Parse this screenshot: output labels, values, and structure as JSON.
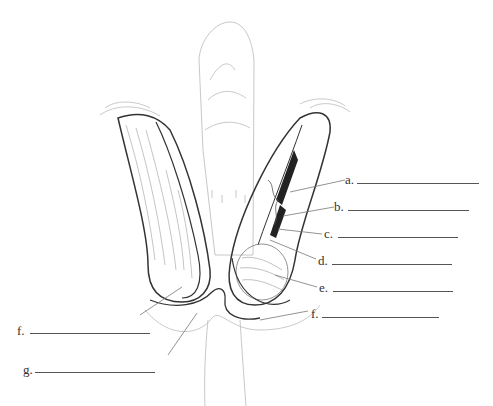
{
  "figure": {
    "labels": [
      {
        "id": "a",
        "text": "a.",
        "x": 345,
        "y": 173,
        "blank_x": 357,
        "blank_w": 122,
        "leader": [
          [
            345,
            180
          ],
          [
            290,
            192
          ]
        ]
      },
      {
        "id": "b",
        "text": "b.",
        "x": 334,
        "y": 200,
        "blank_x": 348,
        "blank_w": 121,
        "leader": [
          [
            334,
            207
          ],
          [
            283,
            216
          ]
        ]
      },
      {
        "id": "c",
        "text": "c.",
        "x": 324,
        "y": 227,
        "blank_x": 338,
        "blank_w": 120,
        "leader": [
          [
            322,
            234
          ],
          [
            278,
            229
          ]
        ]
      },
      {
        "id": "d",
        "text": "d.",
        "x": 318,
        "y": 254,
        "blank_x": 332,
        "blank_w": 120,
        "leader": [
          [
            316,
            259
          ],
          [
            270,
            240
          ]
        ]
      },
      {
        "id": "e",
        "text": "e.",
        "x": 319,
        "y": 281,
        "blank_x": 333,
        "blank_w": 120,
        "leader": [
          [
            317,
            287
          ],
          [
            275,
            275
          ]
        ]
      },
      {
        "id": "f_right",
        "text": "f.",
        "x": 311,
        "y": 307,
        "blank_x": 322,
        "blank_w": 117,
        "leader": [
          [
            308,
            311
          ],
          [
            260,
            320
          ]
        ]
      },
      {
        "id": "f_left",
        "text": "f.",
        "x": 17,
        "y": 324,
        "blank_x": 30,
        "blank_w": 120,
        "leader": [
          [
            140,
            315
          ],
          [
            182,
            287
          ]
        ]
      },
      {
        "id": "g",
        "text": "g.",
        "x": 23,
        "y": 363,
        "blank_x": 35,
        "blank_w": 120,
        "leader": [
          [
            168,
            355
          ],
          [
            197,
            313
          ]
        ]
      }
    ]
  },
  "colors": {
    "outline_dark": "#222222",
    "outline_mid": "#777777",
    "outline_light": "#bbbbbb",
    "blank_line": "#555555",
    "label_text": "#333333"
  }
}
